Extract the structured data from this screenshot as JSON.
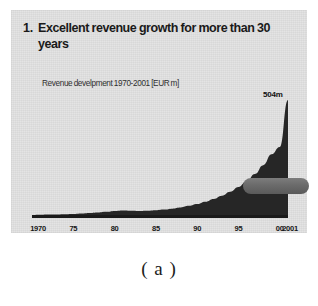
{
  "slide": {
    "title_number": "1.",
    "title": "Excellent revenue growth for more than 30 years",
    "subtitle": "Revenue develpment 1970-2001 [EUR m]",
    "peak_label": "504m",
    "background_color": "#e4e4e4"
  },
  "caption": "( a )",
  "colors": {
    "area_fill": "#262626",
    "axis_line": "#1a1a1a",
    "callout_pill": "#6b6b6b",
    "slide_background": "#e4e4e4",
    "page_background": "#ffffff",
    "text": "#1a1a1a"
  },
  "callout": {
    "shape": "rounded-pill",
    "label": ""
  },
  "chart_data": {
    "type": "area",
    "title": "Revenue develpment 1970-2001 [EUR m]",
    "xlabel": "",
    "ylabel": "EUR m",
    "ylim": [
      0,
      504
    ],
    "xlim": [
      1970,
      2001
    ],
    "grid": false,
    "legend": false,
    "annotations": [
      {
        "text": "504m",
        "x": 2001,
        "y": 504
      }
    ],
    "tick_labels": [
      "1970",
      "75",
      "80",
      "85",
      "90",
      "95",
      "00",
      "2001"
    ],
    "tick_years": [
      1970,
      1975,
      1980,
      1985,
      1990,
      1995,
      2000,
      2001
    ],
    "x": [
      1970,
      1971,
      1972,
      1973,
      1974,
      1975,
      1976,
      1977,
      1978,
      1979,
      1980,
      1981,
      1982,
      1983,
      1984,
      1985,
      1986,
      1987,
      1988,
      1989,
      1990,
      1991,
      1992,
      1993,
      1994,
      1995,
      1996,
      1997,
      1998,
      1999,
      2000,
      2001
    ],
    "values": [
      4,
      5,
      6,
      7,
      8,
      9,
      11,
      13,
      15,
      18,
      22,
      24,
      23,
      22,
      23,
      25,
      28,
      32,
      37,
      44,
      52,
      62,
      74,
      88,
      105,
      126,
      152,
      183,
      221,
      268,
      300,
      504
    ],
    "series": [
      {
        "name": "Revenue",
        "values": [
          4,
          5,
          6,
          7,
          8,
          9,
          11,
          13,
          15,
          18,
          22,
          24,
          23,
          22,
          23,
          25,
          28,
          32,
          37,
          44,
          52,
          62,
          74,
          88,
          105,
          126,
          152,
          183,
          221,
          268,
          300,
          504
        ]
      }
    ]
  }
}
